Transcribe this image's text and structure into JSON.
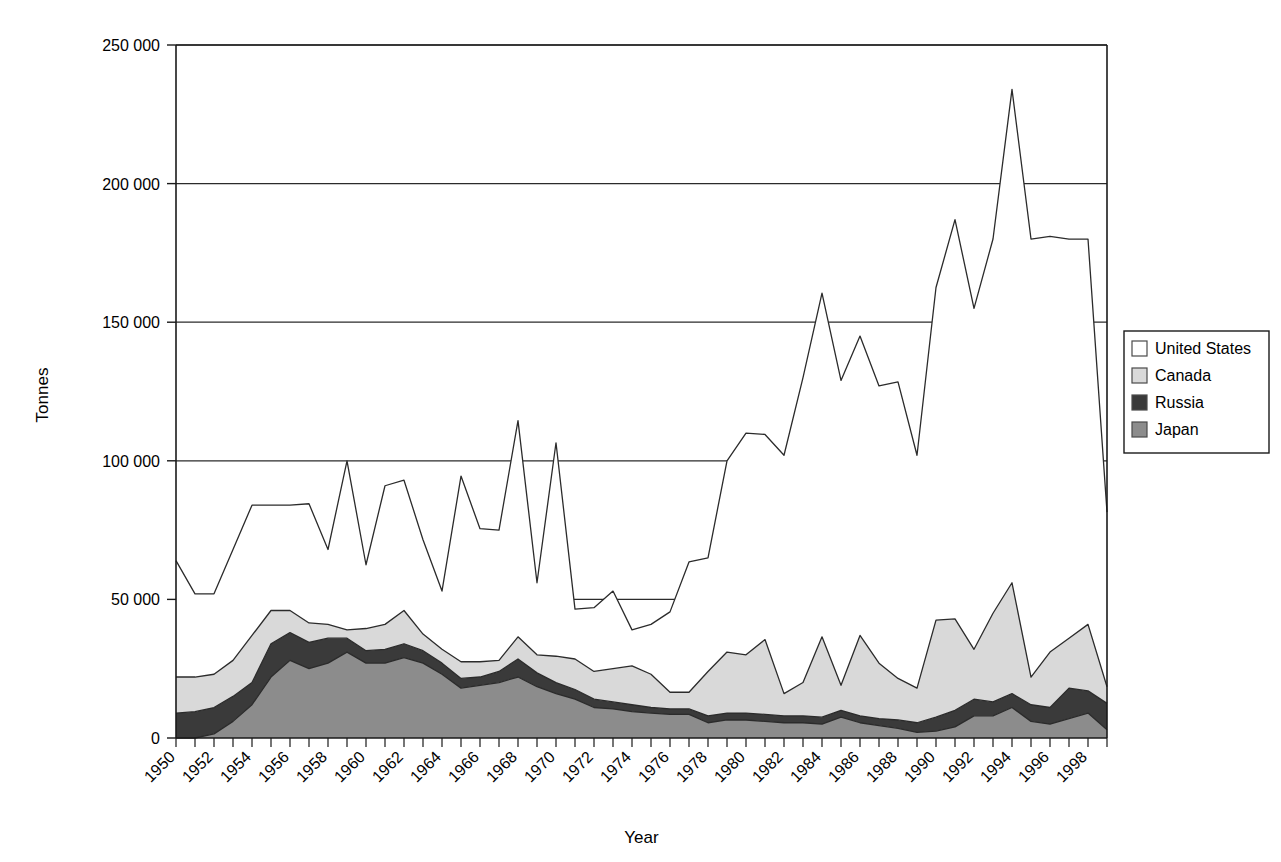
{
  "chart_data": {
    "type": "area",
    "stacked": true,
    "title": "",
    "subtitle": "",
    "xlabel": "Year",
    "ylabel": "Tonnes",
    "xlim": [
      1950,
      1999
    ],
    "ylim": [
      0,
      250000
    ],
    "ytick_labels": [
      "0",
      "50 000",
      "100 000",
      "150 000",
      "200 000",
      "250 000"
    ],
    "ytick_values": [
      0,
      50000,
      100000,
      150000,
      200000,
      250000
    ],
    "grid": "horizontal",
    "legend_position": "right",
    "x": [
      1950,
      1951,
      1952,
      1953,
      1954,
      1955,
      1956,
      1957,
      1958,
      1959,
      1960,
      1961,
      1962,
      1963,
      1964,
      1965,
      1966,
      1967,
      1968,
      1969,
      1970,
      1971,
      1972,
      1973,
      1974,
      1975,
      1976,
      1977,
      1978,
      1979,
      1980,
      1981,
      1982,
      1983,
      1984,
      1985,
      1986,
      1987,
      1988,
      1989,
      1990,
      1991,
      1992,
      1993,
      1994,
      1995,
      1996,
      1997,
      1998,
      1999
    ],
    "xtick_labels": [
      "1950",
      "1952",
      "1954",
      "1956",
      "1958",
      "1960",
      "1962",
      "1964",
      "1966",
      "1968",
      "1970",
      "1972",
      "1974",
      "1976",
      "1978",
      "1980",
      "1982",
      "1984",
      "1986",
      "1988",
      "1990",
      "1992",
      "1994",
      "1996",
      "1998"
    ],
    "series": [
      {
        "name": "Japan",
        "color": "#8c8c8c",
        "stack_order": 1,
        "values": [
          0,
          0,
          1500,
          6000,
          12000,
          22000,
          28000,
          25000,
          27000,
          31000,
          27000,
          27000,
          29000,
          27000,
          23000,
          18000,
          19000,
          20000,
          22000,
          18500,
          16000,
          14000,
          11000,
          10500,
          9500,
          9000,
          8500,
          8500,
          5500,
          6500,
          6500,
          6000,
          5500,
          5500,
          5000,
          7500,
          5500,
          4500,
          3500,
          2000,
          2500,
          4000,
          8000,
          8000,
          11000,
          6000,
          5000,
          7000,
          9000,
          3000
        ]
      },
      {
        "name": "Russia",
        "color": "#3a3a3a",
        "stack_order": 2,
        "values": [
          9000,
          9500,
          9500,
          9000,
          8000,
          12000,
          10000,
          9500,
          9000,
          5000,
          4500,
          5000,
          5000,
          4500,
          4000,
          3500,
          3000,
          4000,
          6500,
          5000,
          4000,
          3500,
          3000,
          2500,
          2500,
          2000,
          2000,
          2000,
          2500,
          2500,
          2500,
          2500,
          2500,
          2500,
          2500,
          2500,
          2500,
          2500,
          3000,
          3500,
          5000,
          6000,
          6000,
          5000,
          5000,
          6000,
          6000,
          11000,
          8000,
          9500
        ]
      },
      {
        "name": "Canada",
        "color": "#d9d9d9",
        "stack_order": 3,
        "values": [
          13000,
          12500,
          12000,
          13000,
          17000,
          12000,
          8000,
          7000,
          5000,
          3000,
          8000,
          9000,
          12000,
          6000,
          5000,
          6000,
          5500,
          4000,
          8000,
          6500,
          9500,
          11000,
          10000,
          12000,
          14000,
          12000,
          6000,
          6000,
          16000,
          22000,
          21000,
          27000,
          8000,
          12000,
          29000,
          9000,
          29000,
          20000,
          15000,
          12500,
          35000,
          33000,
          18000,
          32000,
          40000,
          10000,
          20000,
          18000,
          24000,
          6000
        ]
      },
      {
        "name": "United States",
        "color": "#ffffff",
        "stack_order": 4,
        "values": [
          42000,
          30000,
          29000,
          40000,
          47000,
          38000,
          38000,
          43000,
          27000,
          61000,
          23000,
          50000,
          47000,
          34000,
          21000,
          67000,
          48000,
          47000,
          78000,
          26000,
          77000,
          18000,
          23000,
          28000,
          13000,
          18000,
          29000,
          47000,
          41000,
          69000,
          80000,
          74000,
          86000,
          110000,
          124000,
          110000,
          108000,
          100000,
          107000,
          84000,
          120000,
          144000,
          123000,
          135000,
          178000,
          158000,
          150000,
          144000,
          139000,
          63000
        ]
      }
    ],
    "stack_totals": [
      64000,
      52000,
      52000,
      68000,
      84000,
      84000,
      84000,
      84500,
      68000,
      100000,
      62500,
      91000,
      93000,
      72000,
      53000,
      94500,
      75500,
      75000,
      114500,
      56000,
      106500,
      46500,
      47000,
      53000,
      39500,
      41000,
      45500,
      63500,
      65000,
      100000,
      110000,
      109500,
      102000,
      130000,
      160500,
      129000,
      145000,
      127000,
      128500,
      102000,
      162500,
      187000,
      155000,
      180000,
      234000,
      180000,
      181000,
      180000,
      180000,
      81500
    ]
  },
  "legend": {
    "entries": [
      {
        "label": "United States",
        "swatch": "#ffffff"
      },
      {
        "label": "Canada",
        "swatch": "#d9d9d9"
      },
      {
        "label": "Russia",
        "swatch": "#3a3a3a"
      },
      {
        "label": "Japan",
        "swatch": "#8c8c8c"
      }
    ]
  }
}
